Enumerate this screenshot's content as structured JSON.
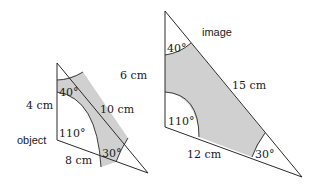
{
  "object": {
    "label": "object",
    "side_left": "4 cm",
    "side_hyp": "10 cm",
    "side_bottom": "8 cm",
    "angle_top": "40°",
    "angle_bl": "110°",
    "angle_br": "30°"
  },
  "image": {
    "label": "image",
    "side_left": "6 cm",
    "side_hyp": "15 cm",
    "side_bottom": "12 cm",
    "angle_top": "40°",
    "angle_bl": "110°",
    "angle_br": "30°"
  },
  "colors": {
    "shade": "#d0d0d0",
    "line": "#2a2a2a"
  }
}
